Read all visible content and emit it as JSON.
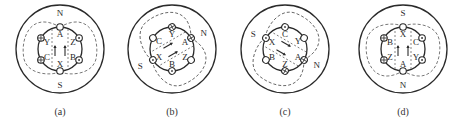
{
  "figure": {
    "stroke_color": "#2a2a2a",
    "dashed_color": "#555555",
    "panels": [
      {
        "id": "a",
        "caption": "(a)",
        "center": [
          60,
          49
        ],
        "rotation_deg": 0,
        "pole_top": "N",
        "pole_bottom": "S",
        "field_direction": "up",
        "slots": [
          {
            "label": "A",
            "symbol": "empty"
          },
          {
            "label": "Z",
            "symbol": "dot"
          },
          {
            "label": "B",
            "symbol": "dot"
          },
          {
            "label": "X",
            "symbol": "empty"
          },
          {
            "label": "C",
            "symbol": "cross"
          },
          {
            "label": "Y",
            "symbol": "cross"
          }
        ]
      },
      {
        "id": "b",
        "caption": "(b)",
        "center": [
          172,
          49
        ],
        "rotation_deg": 60,
        "pole_top": "N",
        "pole_bottom": "S",
        "field_direction": "up",
        "slots": [
          {
            "label": "A",
            "symbol": "cross"
          },
          {
            "label": "Z",
            "symbol": "empty"
          },
          {
            "label": "B",
            "symbol": "dot"
          },
          {
            "label": "X",
            "symbol": "dot"
          },
          {
            "label": "C",
            "symbol": "empty"
          },
          {
            "label": "Y",
            "symbol": "cross"
          }
        ]
      },
      {
        "id": "c",
        "caption": "(c)",
        "center": [
          285,
          49
        ],
        "rotation_deg": 120,
        "pole_top": "N",
        "pole_bottom": "S",
        "field_direction": "up",
        "slots": [
          {
            "label": "A",
            "symbol": "cross"
          },
          {
            "label": "Z",
            "symbol": "cross"
          },
          {
            "label": "B",
            "symbol": "empty"
          },
          {
            "label": "X",
            "symbol": "dot"
          },
          {
            "label": "C",
            "symbol": "dot"
          },
          {
            "label": "Y",
            "symbol": "empty"
          }
        ]
      },
      {
        "id": "d",
        "caption": "(d)",
        "center": [
          403,
          49
        ],
        "rotation_deg": 180,
        "pole_top": "S",
        "pole_bottom": "N",
        "field_direction": "down",
        "slots": [
          {
            "label": "A",
            "symbol": "empty"
          },
          {
            "label": "Z",
            "symbol": "cross"
          },
          {
            "label": "B",
            "symbol": "cross"
          },
          {
            "label": "X",
            "symbol": "empty"
          },
          {
            "label": "C",
            "symbol": "dot"
          },
          {
            "label": "Y",
            "symbol": "dot"
          }
        ]
      }
    ]
  }
}
